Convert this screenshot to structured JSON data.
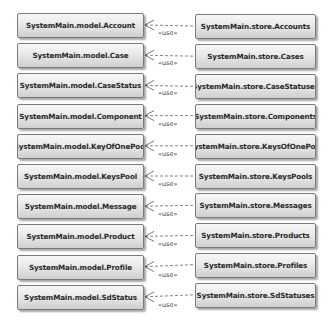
{
  "diagram": {
    "type": "uml-dependency",
    "stereotype": "«use»",
    "relations": [
      {
        "client": "SystemMain.store.Accounts",
        "supplier": "SystemMain.model.Account"
      },
      {
        "client": "SystemMain.store.Cases",
        "supplier": "SystemMain.model.Case"
      },
      {
        "client": "SystemMain.store.CaseStatuses",
        "supplier": "SystemMain.model.CaseStatus"
      },
      {
        "client": "SystemMain.store.Components",
        "supplier": "SystemMain.model.Component"
      },
      {
        "client": "SystemMain.store.KeysOfOnePool",
        "supplier": "SystemMain.model.KeyOfOnePool"
      },
      {
        "client": "SystemMain.store.KeysPools",
        "supplier": "SystemMain.model.KeysPool"
      },
      {
        "client": "SystemMain.store.Messages",
        "supplier": "SystemMain.model.Message"
      },
      {
        "client": "SystemMain.store.Products",
        "supplier": "SystemMain.model.Product"
      },
      {
        "client": "SystemMain.store.Profiles",
        "supplier": "SystemMain.model.Profile"
      },
      {
        "client": "SystemMain.store.SdStatuses",
        "supplier": "SystemMain.model.SdStatus"
      }
    ]
  }
}
